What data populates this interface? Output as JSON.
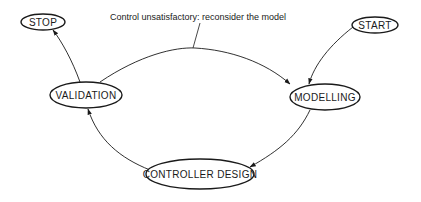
{
  "diagram": {
    "nodes": [
      {
        "id": "stop",
        "label": "STOP",
        "cx": 43,
        "cy": 22,
        "rx": 22,
        "ry": 8
      },
      {
        "id": "start",
        "label": "START",
        "cx": 375,
        "cy": 25,
        "rx": 23,
        "ry": 8
      },
      {
        "id": "validation",
        "label": "VALIDATION",
        "cx": 86,
        "cy": 95,
        "rx": 36,
        "ry": 13
      },
      {
        "id": "modelling",
        "label": "MODELLING",
        "cx": 325,
        "cy": 97,
        "rx": 35,
        "ry": 13
      },
      {
        "id": "controller_design",
        "label": "CONTROLLER DESIGN",
        "cx": 200,
        "cy": 174,
        "rx": 54,
        "ry": 15
      }
    ],
    "edges": [
      {
        "from": "start",
        "to": "modelling"
      },
      {
        "from": "modelling",
        "to": "controller_design"
      },
      {
        "from": "controller_design",
        "to": "validation"
      },
      {
        "from": "validation",
        "to": "stop"
      },
      {
        "from": "validation",
        "to": "modelling",
        "label": "Control unsatisfactory: reconsider the model"
      }
    ],
    "caption": "Control unsatisfactory: reconsider the model",
    "colors": {
      "stroke": "#1a1a1a",
      "background": "#ffffff"
    }
  }
}
